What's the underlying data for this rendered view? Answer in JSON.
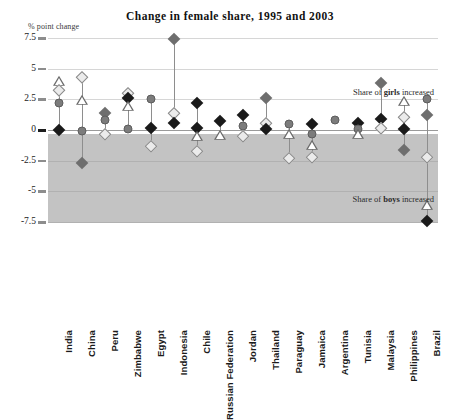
{
  "header": {
    "title": "Change in female share, 1995 and 2003",
    "y_axis_caption": "% point change"
  },
  "annotations": {
    "girls_prefix": "Share of ",
    "girls_bold": "girls",
    "girls_suffix": " increased",
    "boys_prefix": "Share of ",
    "boys_bold": "boys",
    "boys_suffix": " increased"
  },
  "colors": {
    "negative_band": "#c3c3c3",
    "gridline": "#d6d6d6",
    "zero_line": "#9a9a9a",
    "marker_dark": "#1a1a1a",
    "marker_gray_diamond": "#6e6e6e",
    "marker_light_diamond": "#ebebeb",
    "marker_circle": "#7c7c7c",
    "marker_triangle_fill": "#ffffff",
    "text": "#1b1b1b"
  },
  "chart_data": {
    "type": "scatter",
    "title": "Change in female share, 1995 and 2003",
    "xlabel": "",
    "ylabel": "% point change",
    "ylim": [
      -7.5,
      7.5
    ],
    "yticks": [
      7.5,
      5,
      2.5,
      0,
      -2.5,
      -5,
      -7.5
    ],
    "ytick_labels": [
      "7.5",
      "5",
      "2.5",
      "0",
      "-2.5",
      "-5",
      "-7.5"
    ],
    "grid": true,
    "legend_position": "none",
    "shaded_region": {
      "from": 0,
      "to": -7.5,
      "label": "Share of boys increased"
    },
    "categories": [
      "India",
      "China",
      "Peru",
      "Zimbabwe",
      "Egypt",
      "Indonesia",
      "Chile",
      "Russian Federation",
      "Jordan",
      "Thailand",
      "Paraguay",
      "Jamaica",
      "Argentina",
      "Tunisia",
      "Malaysia",
      "Philippines",
      "Brazil"
    ],
    "marker_types": [
      "dark-diamond",
      "gray-diamond",
      "light-diamond",
      "gray-circle",
      "open-triangle"
    ],
    "points": [
      {
        "category": "India",
        "values": [
          {
            "marker": "open-triangle",
            "y": 3.9
          },
          {
            "marker": "light-diamond",
            "y": 3.3
          },
          {
            "marker": "gray-circle",
            "y": 2.2
          },
          {
            "marker": "dark-diamond",
            "y": 0.0
          }
        ]
      },
      {
        "category": "China",
        "values": [
          {
            "marker": "light-diamond",
            "y": 4.3
          },
          {
            "marker": "open-triangle",
            "y": 2.4
          },
          {
            "marker": "gray-circle",
            "y": -0.1
          },
          {
            "marker": "gray-diamond",
            "y": -2.7
          }
        ]
      },
      {
        "category": "Peru",
        "values": [
          {
            "marker": "gray-diamond",
            "y": 1.4
          },
          {
            "marker": "gray-circle",
            "y": 0.8
          },
          {
            "marker": "light-diamond",
            "y": -0.3
          }
        ]
      },
      {
        "category": "Zimbabwe",
        "values": [
          {
            "marker": "light-diamond",
            "y": 3.0
          },
          {
            "marker": "dark-diamond",
            "y": 2.6
          },
          {
            "marker": "open-triangle",
            "y": 1.9
          },
          {
            "marker": "gray-circle",
            "y": 0.1
          }
        ]
      },
      {
        "category": "Egypt",
        "values": [
          {
            "marker": "gray-circle",
            "y": 2.5
          },
          {
            "marker": "dark-diamond",
            "y": 0.2
          },
          {
            "marker": "light-diamond",
            "y": -1.3
          }
        ]
      },
      {
        "category": "Indonesia",
        "values": [
          {
            "marker": "gray-diamond",
            "y": 7.4
          },
          {
            "marker": "light-diamond",
            "y": 1.4
          },
          {
            "marker": "dark-diamond",
            "y": 0.6
          }
        ]
      },
      {
        "category": "Chile",
        "values": [
          {
            "marker": "dark-diamond",
            "y": 2.2
          },
          {
            "marker": "dark-diamond",
            "y": 0.2
          },
          {
            "marker": "open-triangle",
            "y": -0.6
          },
          {
            "marker": "light-diamond",
            "y": -1.7
          }
        ]
      },
      {
        "category": "Russian Federation",
        "values": [
          {
            "marker": "dark-diamond",
            "y": 0.7
          },
          {
            "marker": "open-triangle",
            "y": -0.5
          }
        ]
      },
      {
        "category": "Jordan",
        "values": [
          {
            "marker": "dark-diamond",
            "y": 1.2
          },
          {
            "marker": "gray-circle",
            "y": 0.3
          },
          {
            "marker": "light-diamond",
            "y": -0.5
          }
        ]
      },
      {
        "category": "Thailand",
        "values": [
          {
            "marker": "gray-diamond",
            "y": 2.6
          },
          {
            "marker": "light-diamond",
            "y": 0.6
          },
          {
            "marker": "dark-diamond",
            "y": 0.1
          }
        ]
      },
      {
        "category": "Paraguay",
        "values": [
          {
            "marker": "gray-circle",
            "y": 0.5
          },
          {
            "marker": "open-triangle",
            "y": -0.4
          },
          {
            "marker": "light-diamond",
            "y": -2.3
          }
        ]
      },
      {
        "category": "Jamaica",
        "values": [
          {
            "marker": "dark-diamond",
            "y": 0.5
          },
          {
            "marker": "gray-circle",
            "y": -0.3
          },
          {
            "marker": "open-triangle",
            "y": -1.3
          },
          {
            "marker": "light-diamond",
            "y": -2.2
          }
        ]
      },
      {
        "category": "Argentina",
        "values": [
          {
            "marker": "gray-circle",
            "y": 0.8
          }
        ]
      },
      {
        "category": "Tunisia",
        "values": [
          {
            "marker": "dark-diamond",
            "y": 0.6
          },
          {
            "marker": "gray-circle",
            "y": 0.1
          },
          {
            "marker": "open-triangle",
            "y": -0.4
          }
        ]
      },
      {
        "category": "Malaysia",
        "values": [
          {
            "marker": "gray-diamond",
            "y": 3.8
          },
          {
            "marker": "dark-diamond",
            "y": 0.9
          },
          {
            "marker": "light-diamond",
            "y": 0.2
          }
        ]
      },
      {
        "category": "Philippines",
        "values": [
          {
            "marker": "open-triangle",
            "y": 2.3
          },
          {
            "marker": "light-diamond",
            "y": 1.1
          },
          {
            "marker": "dark-diamond",
            "y": 0.1
          },
          {
            "marker": "gray-diamond",
            "y": -1.6
          }
        ]
      },
      {
        "category": "Brazil",
        "values": [
          {
            "marker": "gray-circle",
            "y": 2.5
          },
          {
            "marker": "gray-diamond",
            "y": 1.2
          },
          {
            "marker": "light-diamond",
            "y": -2.2
          },
          {
            "marker": "open-triangle",
            "y": -6.2
          },
          {
            "marker": "dark-diamond",
            "y": -7.4
          }
        ]
      }
    ]
  }
}
